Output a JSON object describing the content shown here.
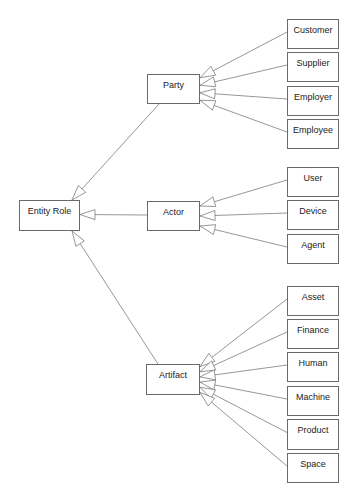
{
  "diagram": {
    "root": {
      "label": "Entity Role",
      "box": [
        19,
        200,
        61,
        31
      ]
    },
    "groups": [
      {
        "label": "Party",
        "box": [
          147,
          74,
          53,
          30
        ],
        "children": [
          {
            "label": "Customer",
            "box": [
              287,
              19,
              52,
              30
            ]
          },
          {
            "label": "Supplier",
            "box": [
              287,
              52,
              52,
              30
            ]
          },
          {
            "label": "Employer",
            "box": [
              287,
              86,
              52,
              30
            ]
          },
          {
            "label": "Employee",
            "box": [
              287,
              119,
              52,
              30
            ]
          }
        ]
      },
      {
        "label": "Actor",
        "box": [
          147,
          201,
          53,
          30
        ],
        "children": [
          {
            "label": "User",
            "box": [
              287,
              167,
              52,
              30
            ]
          },
          {
            "label": "Device",
            "box": [
              287,
              200,
              52,
              30
            ]
          },
          {
            "label": "Agent",
            "box": [
              287,
              234,
              52,
              30
            ]
          }
        ]
      },
      {
        "label": "Artifact",
        "box": [
          146,
          364,
          54,
          31
        ],
        "children": [
          {
            "label": "Asset",
            "box": [
              287,
              286,
              52,
              30
            ]
          },
          {
            "label": "Finance",
            "box": [
              287,
              319,
              52,
              30
            ]
          },
          {
            "label": "Human",
            "box": [
              287,
              352,
              52,
              30
            ]
          },
          {
            "label": "Machine",
            "box": [
              287,
              386,
              52,
              30
            ]
          },
          {
            "label": "Product",
            "box": [
              287,
              419,
              52,
              31
            ]
          },
          {
            "label": "Space",
            "box": [
              287,
              453,
              52,
              30
            ]
          }
        ]
      }
    ],
    "relationship": "generalization (hollow triangle arrowheads)",
    "colors": {
      "line": "#6a6a6a",
      "text": "#222222",
      "background": "#ffffff"
    }
  }
}
